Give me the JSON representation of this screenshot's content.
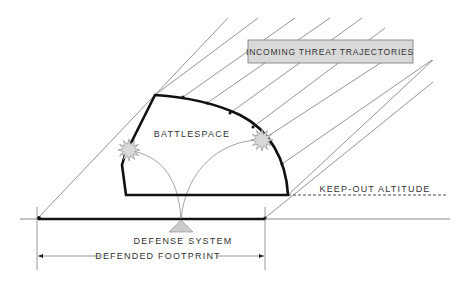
{
  "diagram": {
    "type": "air-defense-battlespace",
    "labels": {
      "incoming": "INCOMING THREAT TRAJECTORIES",
      "battlespace": "BATTLESPACE",
      "keep_out": "KEEP-OUT ALTITUDE",
      "defense_system": "DEFENSE SYSTEM",
      "defended_footprint": "DEFENDED FOOTPRINT"
    },
    "colors": {
      "line": "#555555",
      "boundary": "#111111",
      "label_box_fill": "#d9d9d9",
      "burst_fill": "#d8d8d8",
      "triangle_fill": "#cccccc"
    },
    "trajectory_count": 10,
    "intercept_bursts": 2
  }
}
